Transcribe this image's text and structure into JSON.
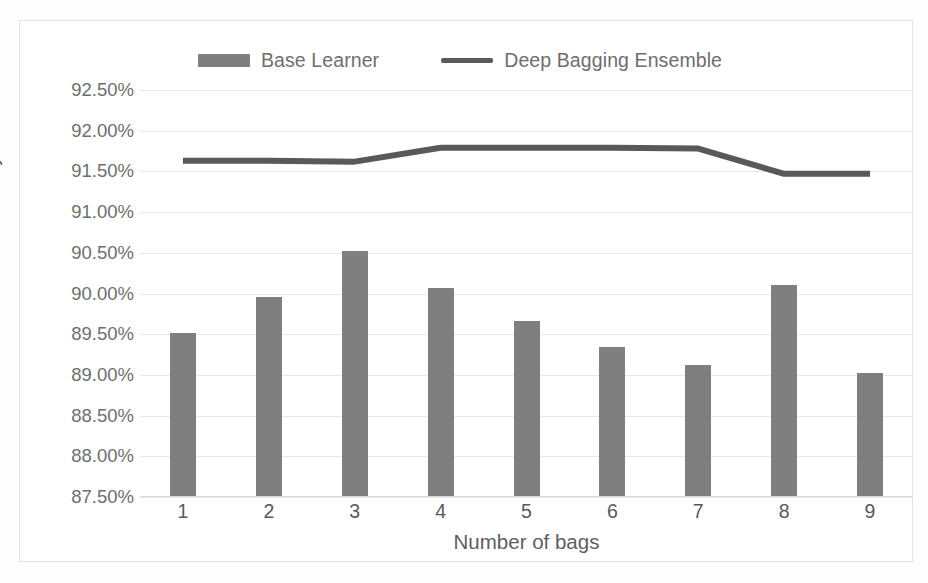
{
  "chart_data": {
    "type": "bar",
    "title": "",
    "xlabel": "Number of bags",
    "ylabel": "Accuracy",
    "categories": [
      "1",
      "2",
      "3",
      "4",
      "5",
      "6",
      "7",
      "8",
      "9"
    ],
    "ylim": [
      87.5,
      92.5
    ],
    "ytick_step": 0.5,
    "ytick_labels": [
      "92.50%",
      "92.00%",
      "91.50%",
      "91.00%",
      "90.50%",
      "90.00%",
      "89.50%",
      "89.00%",
      "88.50%",
      "88.00%",
      "87.50%"
    ],
    "ytick_values": [
      92.5,
      92.0,
      91.5,
      91.0,
      90.5,
      90.0,
      89.5,
      89.0,
      88.5,
      88.0,
      87.5
    ],
    "grid": true,
    "legend_position": "top",
    "series": [
      {
        "name": "Base Learner",
        "type": "bar",
        "color": "#7f7f7f",
        "values": [
          89.51,
          89.96,
          90.52,
          90.07,
          89.66,
          89.34,
          89.12,
          90.1,
          89.02
        ]
      },
      {
        "name": "Deep Bagging Ensemble",
        "type": "line",
        "color": "#595959",
        "values": [
          91.63,
          91.63,
          91.62,
          91.79,
          91.79,
          91.79,
          91.78,
          91.47,
          91.47
        ]
      }
    ]
  },
  "legend": {
    "items": [
      {
        "label": "Base Learner",
        "marker": "bar-swatch-icon"
      },
      {
        "label": "Deep Bagging Ensemble",
        "marker": "line-swatch-icon"
      }
    ]
  },
  "axes": {
    "y_title": "Accuracy",
    "x_title": "Number of bags"
  }
}
